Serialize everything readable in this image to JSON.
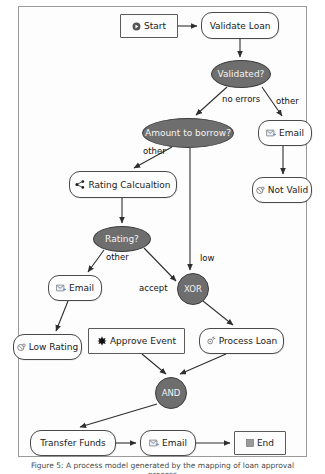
{
  "diagram": {
    "type": "bpmn-flowchart",
    "nodes": [
      {
        "id": "start",
        "label": "Start",
        "shape": "rect",
        "icon": "play-circle-icon",
        "x": 120,
        "y": 14,
        "w": 58,
        "h": 24
      },
      {
        "id": "validate",
        "label": "Validate Loan",
        "shape": "task",
        "icon": "none",
        "x": 201,
        "y": 12,
        "w": 78,
        "h": 27
      },
      {
        "id": "validated",
        "label": "Validated?",
        "shape": "ellipse",
        "icon": "none",
        "x": 211,
        "y": 60,
        "w": 60,
        "h": 28
      },
      {
        "id": "amount",
        "label": "Amount to borrow?",
        "shape": "ellipse",
        "icon": "none",
        "x": 142,
        "y": 118,
        "w": 92,
        "h": 30
      },
      {
        "id": "email1",
        "label": "Email",
        "shape": "task",
        "icon": "email-icon",
        "x": 258,
        "y": 120,
        "w": 54,
        "h": 26
      },
      {
        "id": "notvalid",
        "label": "Not Valid",
        "shape": "task",
        "icon": "error-icon",
        "x": 252,
        "y": 177,
        "w": 60,
        "h": 26
      },
      {
        "id": "rating",
        "label": "Rating Calcualtion",
        "shape": "task",
        "icon": "share-icon",
        "x": 69,
        "y": 171,
        "w": 108,
        "h": 27
      },
      {
        "id": "ratingq",
        "label": "Rating?",
        "shape": "ellipse",
        "icon": "none",
        "x": 93,
        "y": 226,
        "w": 58,
        "h": 26
      },
      {
        "id": "xor",
        "label": "XOR",
        "shape": "gateway",
        "icon": "none",
        "x": 177,
        "y": 273,
        "w": 32,
        "h": 32
      },
      {
        "id": "email2",
        "label": "Email",
        "shape": "task",
        "icon": "email-icon",
        "x": 48,
        "y": 275,
        "w": 54,
        "h": 26
      },
      {
        "id": "lowrating",
        "label": "Low Rating",
        "shape": "task",
        "icon": "error-icon",
        "x": 13,
        "y": 334,
        "w": 69,
        "h": 26
      },
      {
        "id": "approve",
        "label": "Approve Event",
        "shape": "rect",
        "icon": "star-icon",
        "x": 88,
        "y": 328,
        "w": 97,
        "h": 26
      },
      {
        "id": "process",
        "label": "Process Loan",
        "shape": "task",
        "icon": "gear-icon",
        "x": 199,
        "y": 328,
        "w": 85,
        "h": 26
      },
      {
        "id": "and",
        "label": "AND",
        "shape": "gateway",
        "icon": "none",
        "x": 155,
        "y": 377,
        "w": 32,
        "h": 32
      },
      {
        "id": "transfer",
        "label": "Transfer Funds",
        "shape": "task",
        "icon": "none",
        "x": 30,
        "y": 430,
        "w": 86,
        "h": 26
      },
      {
        "id": "email3",
        "label": "Email",
        "shape": "task",
        "icon": "email-icon",
        "x": 140,
        "y": 430,
        "w": 56,
        "h": 26
      },
      {
        "id": "end",
        "label": "End",
        "shape": "rect",
        "icon": "stop-icon",
        "x": 234,
        "y": 431,
        "w": 52,
        "h": 24
      }
    ],
    "edge_labels": [
      {
        "id": "lbl-no-errors",
        "text": "no errors",
        "x": 222,
        "y": 94
      },
      {
        "id": "lbl-other-1",
        "text": "other",
        "x": 276,
        "y": 96
      },
      {
        "id": "lbl-other-2",
        "text": "other",
        "x": 143,
        "y": 146
      },
      {
        "id": "lbl-other-3",
        "text": "other",
        "x": 106,
        "y": 252
      },
      {
        "id": "lbl-low",
        "text": "low",
        "x": 200,
        "y": 253
      },
      {
        "id": "lbl-accept",
        "text": "accept",
        "x": 139,
        "y": 283
      }
    ],
    "colors": {
      "gateway_fill": "#6e6e6e",
      "node_stroke": "#4a4a4a",
      "edge_stroke": "#2e2e2e",
      "frame_border": "#9a9a9a",
      "background": "#ffffff",
      "text": "#1a1a1a"
    }
  },
  "caption": {
    "text": "Figure 5: A process model generated by the mapping of loan approval process"
  }
}
